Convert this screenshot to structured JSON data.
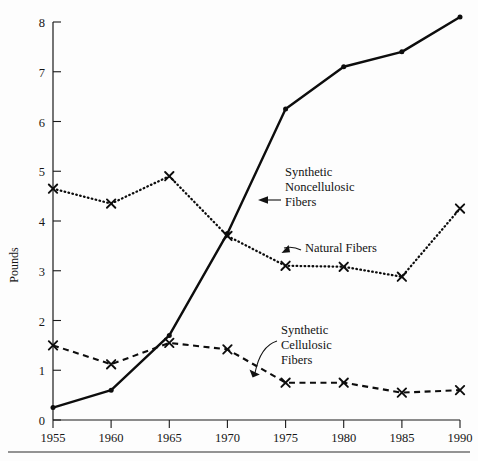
{
  "chart_data": {
    "type": "line",
    "title": "",
    "xlabel": "",
    "ylabel": "Pounds",
    "x": [
      1955,
      1960,
      1965,
      1970,
      1975,
      1980,
      1985,
      1990
    ],
    "xtick_labels": [
      "1955",
      "1960",
      "1965",
      "1970",
      "1975",
      "1980",
      "1985",
      "1990"
    ],
    "ytick_labels": [
      "0",
      "1",
      "2",
      "3",
      "4",
      "5",
      "6",
      "7",
      "8"
    ],
    "yticks": [
      0,
      1,
      2,
      3,
      4,
      5,
      6,
      7,
      8
    ],
    "ylim": [
      0,
      8
    ],
    "xlim": [
      1955,
      1990
    ],
    "grid": false,
    "legend_position": "inline-annotations",
    "series": [
      {
        "name": "Synthetic Noncellulosic Fibers",
        "style": "solid",
        "marker": "dot",
        "values": [
          0.25,
          0.6,
          1.7,
          3.75,
          6.25,
          7.1,
          7.4,
          8.1
        ]
      },
      {
        "name": "Natural Fibers",
        "style": "dotted",
        "marker": "x",
        "values": [
          4.65,
          4.35,
          4.9,
          3.7,
          3.1,
          3.08,
          2.88,
          4.25
        ]
      },
      {
        "name": "Synthetic Cellulosic Fibers",
        "style": "dashed",
        "marker": "x",
        "values": [
          1.5,
          1.12,
          1.55,
          1.42,
          0.75,
          0.75,
          0.55,
          0.6
        ]
      }
    ],
    "annotations": [
      {
        "id": "synthetic-noncellulosic",
        "lines": [
          "Synthetic",
          "Noncellulosic",
          "Fibers"
        ],
        "text": "Synthetic Noncellulosic Fibers"
      },
      {
        "id": "natural-fibers",
        "lines": [
          "Natural Fibers"
        ],
        "text": "Natural Fibers"
      },
      {
        "id": "synthetic-cellulosic",
        "lines": [
          "Synthetic",
          "Cellulosic",
          "Fibers"
        ],
        "text": "Synthetic Cellulosic Fibers"
      }
    ],
    "colors": {
      "ink": "#0d0d0d",
      "axis": "#1a1a1a",
      "background": "#fdfdfd"
    }
  },
  "axis": {
    "y_title": "Pounds",
    "y_ticks": [
      "8",
      "7",
      "6",
      "5",
      "4",
      "3",
      "2",
      "1",
      "0"
    ],
    "x_ticks": [
      "1955",
      "1960",
      "1965",
      "1970",
      "1975",
      "1980",
      "1985",
      "1990"
    ]
  },
  "annotations": {
    "synthetic_noncellulosic": {
      "line1": "Synthetic",
      "line2": "Noncellulosic",
      "line3": "Fibers"
    },
    "natural_fibers": {
      "line1": "Natural Fibers"
    },
    "synthetic_cellulosic": {
      "line1": "Synthetic",
      "line2": "Cellulosic",
      "line3": "Fibers"
    }
  },
  "footer": {
    "source": ""
  }
}
